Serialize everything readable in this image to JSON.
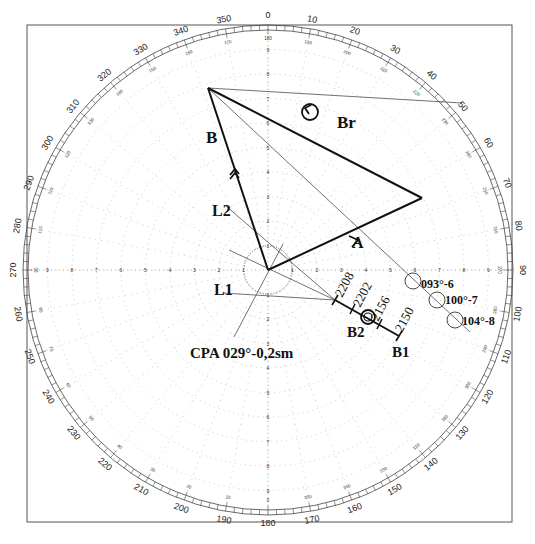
{
  "diagram": {
    "center": {
      "x": 268,
      "y": 270
    },
    "outer_radius": 245,
    "ring_spacing": 24.5,
    "frame": {
      "x": 27,
      "y": 25,
      "w": 485,
      "h": 497
    },
    "colors": {
      "ink": "#111111",
      "grid": "#9a9a9a",
      "frame": "#555555"
    }
  },
  "bearing_scale": {
    "outer_labels": [
      "0",
      "10",
      "20",
      "30",
      "40",
      "50",
      "60",
      "70",
      "80",
      "90",
      "100",
      "110",
      "120",
      "130",
      "140",
      "150",
      "160",
      "170",
      "180",
      "190",
      "200",
      "210",
      "220",
      "230",
      "240",
      "250",
      "260",
      "270",
      "280",
      "290",
      "300",
      "310",
      "320",
      "330",
      "340",
      "350"
    ],
    "inner_labels": [
      "180",
      "190",
      "200",
      "210",
      "220",
      "230",
      "240",
      "250",
      "260",
      "270",
      "280",
      "290",
      "300",
      "310",
      "320",
      "330",
      "340",
      "350",
      "0",
      "10",
      "20",
      "30",
      "40",
      "50",
      "60",
      "70",
      "80",
      "90",
      "100",
      "110",
      "120",
      "130",
      "140",
      "150",
      "160",
      "170"
    ]
  },
  "range_scale": {
    "labels": [
      "1",
      "2",
      "3",
      "4",
      "5",
      "6",
      "7",
      "8",
      "9"
    ]
  },
  "labels": {
    "B": "B",
    "Br": "Br",
    "A": "A",
    "L1": "L1",
    "L2": "L2",
    "B1": "B1",
    "B2": "B2",
    "cpa": "CPA 029°-0,2sm",
    "t2208": "2208",
    "t2202": "2202",
    "t2156": "2156",
    "t2150": "2150",
    "p093": "093°-6",
    "p100": "100°-7",
    "p104": "104°-8"
  },
  "plots": [
    {
      "id": "p093",
      "bearing": "093°",
      "range": 6,
      "x": 413,
      "y": 281
    },
    {
      "id": "p100",
      "bearing": "100°",
      "range": 7,
      "x": 437,
      "y": 300
    },
    {
      "id": "p104",
      "bearing": "104°",
      "range": 8,
      "x": 455,
      "y": 320
    }
  ],
  "vectors": {
    "B": {
      "from": [
        268,
        270
      ],
      "to": [
        208,
        88
      ]
    },
    "A": {
      "from": [
        268,
        270
      ],
      "to": [
        422,
        198
      ]
    },
    "Br": {
      "from": [
        208,
        88
      ],
      "to": [
        422,
        198
      ]
    },
    "B_track": {
      "from": [
        335,
        300
      ],
      "to": [
        399,
        336
      ],
      "times": [
        "2208",
        "2202",
        "2156",
        "2150"
      ]
    }
  }
}
